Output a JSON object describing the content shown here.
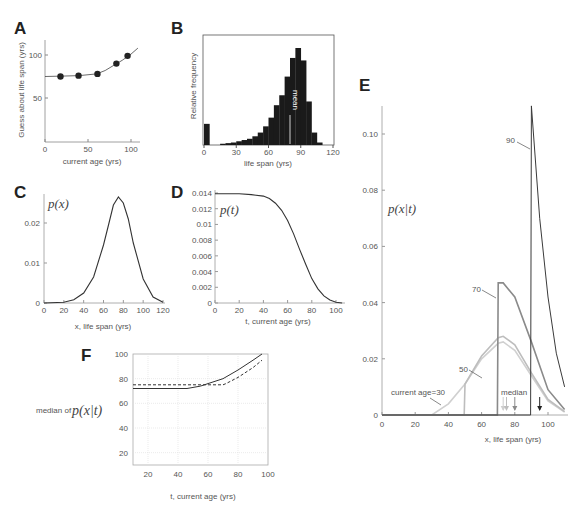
{
  "figure": {
    "panels": [
      "A",
      "B",
      "C",
      "D",
      "E",
      "F"
    ]
  },
  "chart_data": [
    {
      "panel": "A",
      "type": "scatter",
      "title": "",
      "xlabel": "current age (yrs)",
      "ylabel": "Guess about life span (yrs)",
      "xlim": [
        0,
        110
      ],
      "ylim": [
        0,
        120
      ],
      "xticks": [
        "0",
        "50",
        "100"
      ],
      "yticks": [
        "50",
        "100"
      ],
      "points": {
        "x": [
          18,
          39,
          61,
          83,
          96
        ],
        "y": [
          75,
          76,
          78,
          90,
          99
        ]
      },
      "fit_curve": {
        "x": [
          0,
          20,
          40,
          60,
          70,
          80,
          90,
          100,
          108
        ],
        "y": [
          75,
          75.5,
          76,
          78,
          82,
          88,
          94,
          101,
          108
        ]
      }
    },
    {
      "panel": "B",
      "type": "bar",
      "title": "",
      "xlabel": "life span (yrs)",
      "ylabel": "Relative frequency",
      "xlim": [
        0,
        120
      ],
      "xticks": [
        "0",
        "30",
        "60",
        "90",
        "120"
      ],
      "annotation": "mean",
      "mean_x": 80,
      "bin_width": 5,
      "categories": [
        0,
        5,
        10,
        15,
        20,
        25,
        30,
        35,
        40,
        45,
        50,
        55,
        60,
        65,
        70,
        75,
        80,
        85,
        90,
        95,
        100,
        105
      ],
      "values": [
        0.17,
        0,
        0,
        0.01,
        0.015,
        0.02,
        0.03,
        0.04,
        0.05,
        0.07,
        0.1,
        0.15,
        0.22,
        0.32,
        0.4,
        0.55,
        0.7,
        0.78,
        0.68,
        0.35,
        0.1,
        0.02
      ]
    },
    {
      "panel": "C",
      "type": "line",
      "title": "",
      "label": "p(x)",
      "xlabel": "x, life span (yrs)",
      "ylabel": "",
      "xlim": [
        0,
        120
      ],
      "ylim": [
        0,
        0.027
      ],
      "xticks": [
        "0",
        "20",
        "40",
        "60",
        "80",
        "100",
        "120"
      ],
      "yticks": [
        "0",
        "0.01",
        "0.02"
      ],
      "x": [
        0,
        20,
        30,
        40,
        50,
        60,
        65,
        70,
        75,
        80,
        85,
        90,
        100,
        110,
        120
      ],
      "y": [
        0,
        0.0002,
        0.0008,
        0.0025,
        0.0065,
        0.0145,
        0.0195,
        0.0245,
        0.0265,
        0.025,
        0.021,
        0.015,
        0.006,
        0.0015,
        0.0002
      ]
    },
    {
      "panel": "D",
      "type": "line",
      "title": "",
      "label": "p(t)",
      "xlabel": "t, current age (yrs)",
      "ylabel": "",
      "xlim": [
        0,
        105
      ],
      "ylim": [
        0,
        0.014
      ],
      "xticks": [
        "0",
        "20",
        "40",
        "60",
        "80",
        "100"
      ],
      "yticks": [
        "0",
        "0.002",
        "0.004",
        "0.006",
        "0.008",
        "0.01",
        "0.012",
        "0.014"
      ],
      "x": [
        0,
        20,
        30,
        40,
        45,
        50,
        55,
        60,
        65,
        70,
        75,
        80,
        85,
        90,
        95,
        100,
        105
      ],
      "y": [
        0.0139,
        0.0139,
        0.0138,
        0.0136,
        0.0133,
        0.0127,
        0.0118,
        0.0105,
        0.0088,
        0.0068,
        0.0049,
        0.0031,
        0.0018,
        0.0009,
        0.0004,
        0.0001,
        0
      ]
    },
    {
      "panel": "E",
      "type": "line",
      "title": "",
      "label": "p(x|t)",
      "xlabel": "x, life span (yrs)",
      "ylabel": "",
      "xlim": [
        0,
        110
      ],
      "ylim": [
        0,
        0.11
      ],
      "xticks": [
        "0",
        "20",
        "40",
        "60",
        "80",
        "100"
      ],
      "yticks": [
        "0",
        "0.02",
        "0.04",
        "0.06",
        "0.08",
        "0.10"
      ],
      "series": [
        {
          "name": "current age=30",
          "color": "#d0d0d0",
          "x": [
            0,
            30,
            40,
            50,
            60,
            70,
            73,
            80,
            90,
            100,
            110
          ],
          "y": [
            0,
            0,
            0.004,
            0.011,
            0.02,
            0.0255,
            0.026,
            0.023,
            0.014,
            0.005,
            0.001
          ]
        },
        {
          "name": "50",
          "color": "#bdbdbd",
          "x": [
            0,
            49.5,
            50,
            60,
            70,
            73,
            80,
            90,
            100,
            110
          ],
          "y": [
            0,
            0,
            0.011,
            0.021,
            0.0275,
            0.028,
            0.025,
            0.015,
            0.0055,
            0.0012
          ]
        },
        {
          "name": "70",
          "color": "#8a8a8a",
          "x": [
            0,
            69.5,
            70,
            73,
            80,
            90,
            100,
            110
          ],
          "y": [
            0,
            0,
            0.047,
            0.047,
            0.042,
            0.026,
            0.009,
            0.002
          ]
        },
        {
          "name": "90",
          "color": "#3a3a3a",
          "x": [
            0,
            89.5,
            90,
            95,
            100,
            105,
            110
          ],
          "y": [
            0,
            0,
            0.11,
            0.07,
            0.042,
            0.022,
            0.01
          ]
        }
      ],
      "annotations": [
        "current age=30",
        "50",
        "70",
        "90",
        "median"
      ],
      "median_arrows": [
        {
          "x": 73,
          "color": "#cfcfcf"
        },
        {
          "x": 75,
          "color": "#bdbdbd"
        },
        {
          "x": 80,
          "color": "#8a8a8a"
        },
        {
          "x": 95,
          "color": "#222222"
        }
      ]
    },
    {
      "panel": "F",
      "type": "line",
      "title": "",
      "xlabel": "t, current age (yrs)",
      "ylabel": "median of p(x|t)",
      "xlim": [
        10,
        100
      ],
      "ylim": [
        10,
        100
      ],
      "xticks": [
        "20",
        "40",
        "60",
        "80",
        "100"
      ],
      "yticks": [
        "20",
        "40",
        "60",
        "80",
        "100"
      ],
      "grid": true,
      "series": [
        {
          "name": "solid",
          "style": "solid",
          "x": [
            10,
            20,
            30,
            40,
            46,
            55,
            60,
            70,
            80,
            90,
            96
          ],
          "y": [
            72,
            72,
            72,
            72,
            72,
            74,
            76,
            80,
            87,
            95,
            100
          ]
        },
        {
          "name": "dashed",
          "style": "dashed",
          "x": [
            10,
            20,
            30,
            40,
            50,
            60,
            70,
            72,
            80,
            90,
            96
          ],
          "y": [
            75,
            75,
            75,
            75,
            75,
            75,
            75,
            76,
            81,
            89,
            95
          ]
        }
      ]
    }
  ],
  "labels": {
    "A": "A",
    "B": "B",
    "C": "C",
    "D": "D",
    "E": "E",
    "F": "F",
    "a_ylabel": "Guess about life span (yrs)",
    "a_xlabel": "current age (yrs)",
    "b_ylabel": "Relative frequency",
    "b_xlabel": "life span (yrs)",
    "b_mean": "mean",
    "c_label": "p(x)",
    "c_xlabel": "x, life span (yrs)",
    "d_label": "p(t)",
    "d_xlabel": "t, current age (yrs)",
    "e_label": "p(x|t)",
    "e_xlabel": "x, life span (yrs)",
    "e_age30": "current age=30",
    "e_50": "50",
    "e_70": "70",
    "e_90": "90",
    "e_median": "median",
    "f_ylabel_prefix": "median of",
    "f_ylabel_math": "p(x|t)",
    "f_xlabel": "t, current age (yrs)"
  }
}
